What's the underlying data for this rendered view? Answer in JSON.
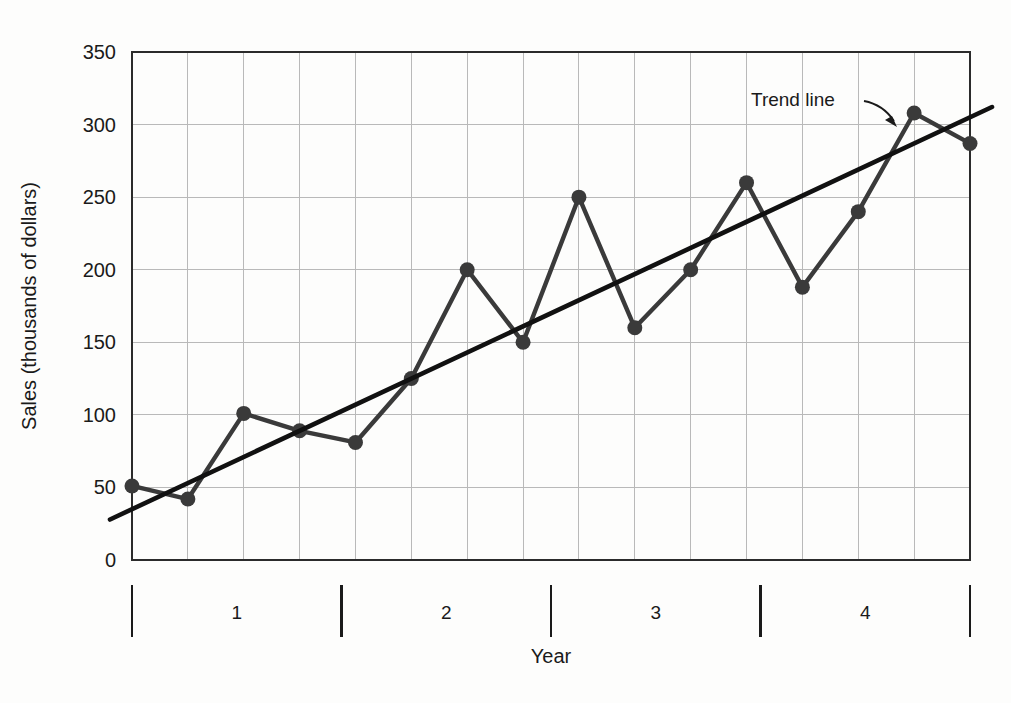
{
  "chart_data": {
    "type": "line",
    "title": "",
    "subtitle": "",
    "xlabel": "Year",
    "ylabel": "Sales (thousands of dollars)",
    "ylim": [
      0,
      350
    ],
    "y_ticks": [
      0,
      50,
      100,
      150,
      200,
      250,
      300,
      350
    ],
    "y_tick_labels": [
      "0",
      "50",
      "100",
      "150",
      "200",
      "250",
      "300",
      "350"
    ],
    "grid": true,
    "grid_axis": "both",
    "legend": "none",
    "x_group_labels": [
      "1",
      "2",
      "3",
      "4"
    ],
    "periods_per_group": 4,
    "x": [
      1,
      2,
      3,
      4,
      5,
      6,
      7,
      8,
      9,
      10,
      11,
      12,
      13,
      14,
      15,
      16
    ],
    "series": [
      {
        "name": "Sales",
        "marker": "circle",
        "values": [
          51,
          42,
          101,
          89,
          81,
          125,
          200,
          150,
          250,
          160,
          200,
          260,
          188,
          240,
          308,
          287
        ]
      },
      {
        "name": "Trend line",
        "marker": "none",
        "values": [
          35,
          53,
          71,
          89,
          107,
          125,
          143,
          161,
          179,
          197,
          215,
          233,
          251,
          269,
          287,
          305
        ]
      }
    ],
    "annotations": [
      {
        "text": "Trend line",
        "target_x": 14.6,
        "target_y": 300
      }
    ],
    "colors": {
      "series_line": "#3a3a3a",
      "trend_line": "#111111",
      "grid": "#b9b9b9",
      "axis": "#2b2b2b",
      "text": "#1a1a1a",
      "background": "#fdfdfc"
    }
  }
}
